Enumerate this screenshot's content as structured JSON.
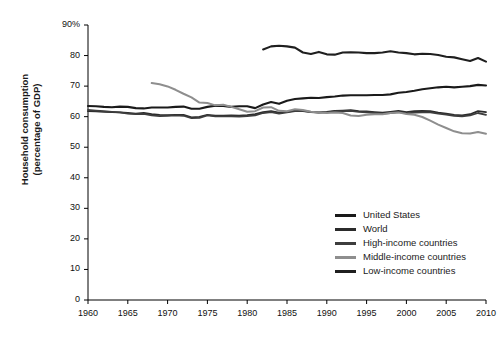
{
  "chart_data": {
    "type": "line",
    "title": "",
    "xlabel": "",
    "ylabel_line1": "Household consumption",
    "ylabel_line2": "(percentage of GDP)",
    "xlim": [
      1960,
      2010
    ],
    "ylim": [
      0,
      90
    ],
    "xticks": [
      1960,
      1965,
      1970,
      1975,
      1980,
      1985,
      1990,
      1995,
      2000,
      2005,
      2010
    ],
    "xticklabels": [
      "1960",
      "1965",
      "1970",
      "1975",
      "1980",
      "1985",
      "1990",
      "1995",
      "2000",
      "2005",
      "2010"
    ],
    "yticks": [
      0,
      10,
      20,
      30,
      40,
      50,
      60,
      70,
      80,
      90
    ],
    "yticklabels": [
      "0",
      "10",
      "20",
      "30",
      "40",
      "50",
      "60",
      "70",
      "80",
      "90%"
    ],
    "grid": false,
    "legend_position": "center-right",
    "series": [
      {
        "name": "United States",
        "color": "#1a1a1a",
        "width": 2.1,
        "x": [
          1960,
          1961,
          1962,
          1963,
          1964,
          1965,
          1966,
          1967,
          1968,
          1969,
          1970,
          1971,
          1972,
          1973,
          1974,
          1975,
          1976,
          1977,
          1978,
          1979,
          1980,
          1981,
          1982,
          1983,
          1984,
          1985,
          1986,
          1987,
          1988,
          1989,
          1990,
          1991,
          1992,
          1993,
          1994,
          1995,
          1996,
          1997,
          1998,
          1999,
          2000,
          2001,
          2002,
          2003,
          2004,
          2005,
          2006,
          2007,
          2008,
          2009,
          2010
        ],
        "y": [
          63.5,
          63.4,
          63.2,
          63.1,
          63.3,
          63.2,
          62.8,
          62.7,
          63.0,
          63.0,
          63.0,
          63.2,
          63.3,
          62.6,
          62.6,
          63.2,
          63.6,
          63.5,
          63.2,
          63.4,
          63.4,
          62.8,
          64.0,
          64.8,
          64.2,
          65.2,
          65.8,
          66.0,
          66.2,
          66.1,
          66.4,
          66.6,
          66.9,
          67.0,
          67.0,
          67.0,
          67.1,
          67.1,
          67.3,
          67.8,
          68.1,
          68.5,
          69.0,
          69.3,
          69.6,
          69.8,
          69.6,
          69.8,
          70.0,
          70.4,
          70.2
        ]
      },
      {
        "name": "World",
        "color": "#2b2b2b",
        "width": 1.8,
        "x": [
          1960,
          1961,
          1962,
          1963,
          1964,
          1965,
          1966,
          1967,
          1968,
          1969,
          1970,
          1971,
          1972,
          1973,
          1974,
          1975,
          1976,
          1977,
          1978,
          1979,
          1980,
          1981,
          1982,
          1983,
          1984,
          1985,
          1986,
          1987,
          1988,
          1989,
          1990,
          1991,
          1992,
          1993,
          1994,
          1995,
          1996,
          1997,
          1998,
          1999,
          2000,
          2001,
          2002,
          2003,
          2004,
          2005,
          2006,
          2007,
          2008,
          2009,
          2010
        ],
        "y": [
          61.8,
          61.7,
          61.6,
          61.5,
          61.4,
          61.2,
          61.0,
          61.2,
          60.8,
          60.6,
          60.5,
          60.6,
          60.6,
          59.8,
          59.9,
          60.6,
          60.3,
          60.3,
          60.4,
          60.3,
          60.5,
          60.8,
          61.5,
          61.8,
          61.3,
          61.6,
          62.0,
          61.9,
          61.6,
          61.4,
          61.6,
          61.9,
          62.0,
          62.1,
          61.8,
          61.7,
          61.5,
          61.3,
          61.6,
          61.9,
          61.5,
          61.8,
          61.9,
          61.8,
          61.3,
          61.0,
          60.6,
          60.4,
          60.8,
          61.8,
          61.5
        ]
      },
      {
        "name": "High-income countries",
        "color": "#3d3d3d",
        "width": 1.8,
        "x": [
          1960,
          1961,
          1962,
          1963,
          1964,
          1965,
          1966,
          1967,
          1968,
          1969,
          1970,
          1971,
          1972,
          1973,
          1974,
          1975,
          1976,
          1977,
          1978,
          1979,
          1980,
          1981,
          1982,
          1983,
          1984,
          1985,
          1986,
          1987,
          1988,
          1989,
          1990,
          1991,
          1992,
          1993,
          1994,
          1995,
          1996,
          1997,
          1998,
          1999,
          2000,
          2001,
          2002,
          2003,
          2004,
          2005,
          2006,
          2007,
          2008,
          2009,
          2010
        ],
        "y": [
          62.2,
          62.0,
          61.8,
          61.6,
          61.4,
          61.0,
          60.8,
          60.9,
          60.4,
          60.2,
          60.3,
          60.4,
          60.3,
          59.5,
          59.6,
          60.4,
          60.1,
          60.1,
          60.1,
          60.0,
          60.2,
          60.4,
          61.2,
          61.5,
          61.0,
          61.4,
          61.8,
          61.8,
          61.5,
          61.3,
          61.4,
          61.7,
          61.8,
          61.9,
          61.6,
          61.4,
          61.2,
          61.0,
          61.2,
          61.5,
          61.1,
          61.3,
          61.4,
          61.4,
          61.0,
          60.7,
          60.3,
          60.1,
          60.4,
          61.2,
          60.6
        ]
      },
      {
        "name": "Middle-income countries",
        "color": "#8e8e8e",
        "width": 2.0,
        "x": [
          1968,
          1969,
          1970,
          1971,
          1972,
          1973,
          1974,
          1975,
          1976,
          1977,
          1978,
          1979,
          1980,
          1981,
          1982,
          1983,
          1984,
          1985,
          1986,
          1987,
          1988,
          1989,
          1990,
          1991,
          1992,
          1993,
          1994,
          1995,
          1996,
          1997,
          1998,
          1999,
          2000,
          2001,
          2002,
          2003,
          2004,
          2005,
          2006,
          2007,
          2008,
          2009,
          2010
        ],
        "y": [
          71.0,
          70.6,
          69.9,
          68.8,
          67.5,
          66.3,
          64.6,
          64.5,
          63.7,
          63.9,
          63.2,
          62.4,
          61.6,
          61.8,
          63.0,
          63.1,
          61.9,
          61.8,
          62.4,
          62.2,
          61.6,
          61.4,
          61.2,
          61.4,
          61.2,
          60.4,
          60.2,
          60.6,
          60.8,
          60.8,
          61.2,
          61.4,
          60.9,
          60.6,
          59.9,
          58.7,
          57.4,
          56.3,
          55.2,
          54.6,
          54.5,
          55.0,
          54.4
        ]
      },
      {
        "name": "Low-income countries",
        "color": "#1f1f1f",
        "width": 2.1,
        "x": [
          1982,
          1983,
          1984,
          1985,
          1986,
          1987,
          1988,
          1989,
          1990,
          1991,
          1992,
          1993,
          1994,
          1995,
          1996,
          1997,
          1998,
          1999,
          2000,
          2001,
          2002,
          2003,
          2004,
          2005,
          2006,
          2007,
          2008,
          2009,
          2010
        ],
        "y": [
          82.0,
          83.0,
          83.2,
          83.0,
          82.6,
          81.0,
          80.5,
          81.2,
          80.4,
          80.3,
          81.0,
          81.1,
          81.0,
          80.8,
          80.8,
          81.0,
          81.4,
          81.0,
          80.8,
          80.4,
          80.6,
          80.5,
          80.2,
          79.6,
          79.4,
          78.8,
          78.2,
          79.2,
          78.0
        ]
      }
    ]
  },
  "legend": {
    "items": [
      {
        "label": "United States",
        "color": "#1a1a1a"
      },
      {
        "label": "World",
        "color": "#2b2b2b"
      },
      {
        "label": "High-income countries",
        "color": "#3d3d3d"
      },
      {
        "label": "Middle-income countries",
        "color": "#8e8e8e"
      },
      {
        "label": "Low-income countries",
        "color": "#1f1f1f"
      }
    ]
  }
}
